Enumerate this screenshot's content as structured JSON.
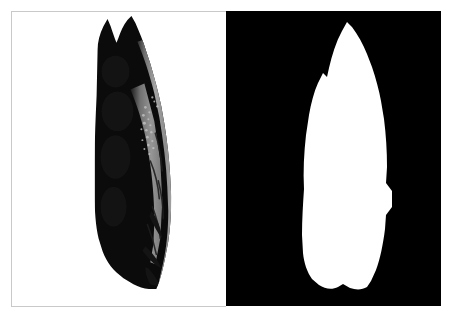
{
  "figure": {
    "width": 453,
    "height": 324,
    "background_color": "#ffffff",
    "layout": "two-panel-side-by-side"
  },
  "panels": [
    {
      "id": "photo",
      "name": "artifact-photograph",
      "caption": "",
      "background_color": "#ffffff",
      "border_color": "#c9c9c9",
      "x": 11,
      "y": 11,
      "width": 215,
      "height": 296,
      "subject": {
        "name": "stone-blade-artifact",
        "description": "Elongated flaked stone blade, vertically oriented, dark shadowed left face with lighter gray textured fractured right edge",
        "silhouette_color": "#0a0a0a",
        "edge_highlight_color": "#9a9a9a",
        "bbox": {
          "x": 85,
          "y": 18,
          "width": 85,
          "height": 272
        }
      }
    },
    {
      "id": "mask",
      "name": "artifact-binary-mask",
      "caption": "",
      "background_color": "#000000",
      "border_color": "#000000",
      "x": 226,
      "y": 11,
      "width": 215,
      "height": 295,
      "subject": {
        "name": "stone-blade-mask",
        "description": "White binary silhouette of the same stone blade on black background",
        "silhouette_color": "#ffffff",
        "bbox": {
          "x": 300,
          "y": 21,
          "width": 90,
          "height": 270
        }
      }
    }
  ],
  "colors": {
    "white": "#ffffff",
    "black": "#000000",
    "frame_gray": "#c9c9c9",
    "artifact_dark": "#0a0a0a",
    "artifact_light": "#9e9e9e",
    "artifact_midtone": "#6b6b6b"
  }
}
